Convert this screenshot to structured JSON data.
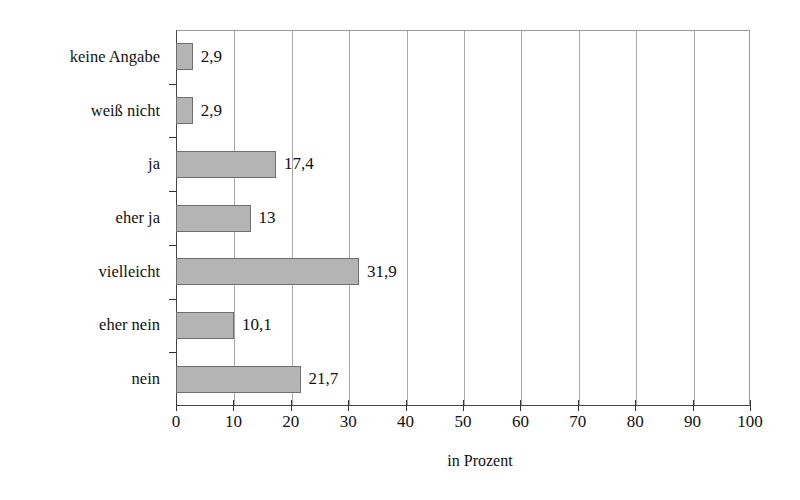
{
  "chart_data": {
    "type": "bar",
    "orientation": "horizontal",
    "title": "",
    "xlabel": "in Prozent",
    "ylabel": "",
    "xlim": [
      0,
      100
    ],
    "xticks": [
      0,
      10,
      20,
      30,
      40,
      50,
      60,
      70,
      80,
      90,
      100
    ],
    "grid": "vertical",
    "legend": "none",
    "categories": [
      "keine Angabe",
      "weiß nicht",
      "ja",
      "eher ja",
      "vielleicht",
      "eher nein",
      "nein"
    ],
    "values": [
      2.9,
      2.9,
      17.4,
      13,
      31.9,
      10.1,
      21.7
    ],
    "value_labels": [
      "2,9",
      "2,9",
      "17,4",
      "13",
      "31,9",
      "10,1",
      "21,7"
    ],
    "bar_color": "#b4b4b4",
    "bar_edge_color": "#6f6f6f",
    "axis_color": "#333333",
    "grid_color": "#a8a8a8"
  }
}
